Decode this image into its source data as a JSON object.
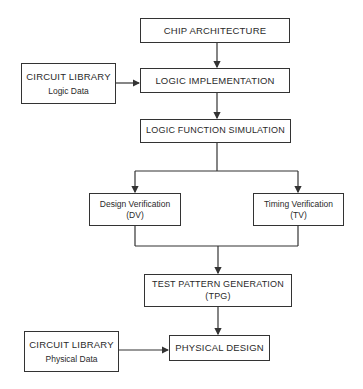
{
  "nodes": {
    "chip_architecture": {
      "label": "CHIP ARCHITECTURE"
    },
    "circuit_library_logic": {
      "title": "CIRCUIT LIBRARY",
      "subtitle": "Logic Data"
    },
    "logic_implementation": {
      "label": "LOGIC IMPLEMENTATION"
    },
    "logic_function_simulation": {
      "label": "LOGIC FUNCTION SIMULATION"
    },
    "design_verification": {
      "title": "Design Verification",
      "subtitle": "(DV)"
    },
    "timing_verification": {
      "title": "Timing Verification",
      "subtitle": "(TV)"
    },
    "test_pattern_generation": {
      "title": "TEST PATTERN GENERATION",
      "subtitle": "(TPG)"
    },
    "circuit_library_physical": {
      "title": "CIRCUIT LIBRARY",
      "subtitle": "Physical Data"
    },
    "physical_design": {
      "label": "PHYSICAL DESIGN"
    }
  },
  "edges": [
    {
      "from": "chip_architecture",
      "to": "logic_implementation"
    },
    {
      "from": "circuit_library_logic",
      "to": "logic_implementation"
    },
    {
      "from": "logic_implementation",
      "to": "logic_function_simulation"
    },
    {
      "from": "logic_function_simulation",
      "to": "design_verification"
    },
    {
      "from": "logic_function_simulation",
      "to": "timing_verification"
    },
    {
      "from": "design_verification",
      "to": "test_pattern_generation"
    },
    {
      "from": "timing_verification",
      "to": "test_pattern_generation"
    },
    {
      "from": "test_pattern_generation",
      "to": "physical_design"
    },
    {
      "from": "circuit_library_physical",
      "to": "physical_design"
    }
  ],
  "colors": {
    "line": "#333333",
    "text": "#2a2a2a",
    "background": "#ffffff"
  }
}
